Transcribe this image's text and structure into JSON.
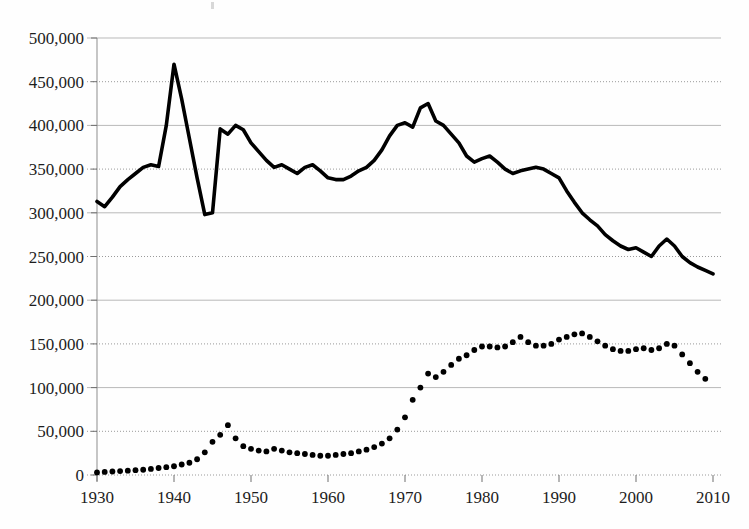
{
  "chart_data": {
    "type": "line",
    "title": "",
    "xlabel": "",
    "ylabel": "",
    "xlim": [
      1930,
      2010
    ],
    "ylim": [
      0,
      500000
    ],
    "grid": true,
    "legend": "none",
    "x_tick_labels": [
      "1930",
      "1940",
      "1950",
      "1960",
      "1970",
      "1980",
      "1990",
      "2000",
      "2010"
    ],
    "x_ticks": [
      1930,
      1940,
      1950,
      1960,
      1970,
      1980,
      1990,
      2000,
      2010
    ],
    "y_tick_labels": [
      "0",
      "50,000",
      "100,000",
      "150,000",
      "200,000",
      "250,000",
      "300,000",
      "350,000",
      "400,000",
      "450,000",
      "500,000"
    ],
    "y_ticks": [
      0,
      50000,
      100000,
      150000,
      200000,
      250000,
      300000,
      350000,
      400000,
      450000,
      500000
    ],
    "series": [
      {
        "name": "solid-line-series",
        "style": "solid",
        "color": "#000000",
        "x": [
          1930,
          1931,
          1932,
          1933,
          1934,
          1935,
          1936,
          1937,
          1938,
          1939,
          1940,
          1941,
          1942,
          1943,
          1944,
          1945,
          1946,
          1947,
          1948,
          1949,
          1950,
          1951,
          1952,
          1953,
          1954,
          1955,
          1956,
          1957,
          1958,
          1959,
          1960,
          1961,
          1962,
          1963,
          1964,
          1965,
          1966,
          1967,
          1968,
          1969,
          1970,
          1971,
          1972,
          1973,
          1974,
          1975,
          1976,
          1977,
          1978,
          1979,
          1980,
          1981,
          1982,
          1983,
          1984,
          1985,
          1986,
          1987,
          1988,
          1989,
          1990,
          1991,
          1992,
          1993,
          1994,
          1995,
          1996,
          1997,
          1998,
          1999,
          2000,
          2001,
          2002,
          2003,
          2004,
          2005,
          2006,
          2007,
          2008,
          2009,
          2010
        ],
        "values": [
          313000,
          307000,
          318000,
          330000,
          338000,
          345000,
          352000,
          355000,
          353000,
          400000,
          470000,
          430000,
          385000,
          340000,
          298000,
          300000,
          396000,
          390000,
          400000,
          395000,
          380000,
          370000,
          360000,
          352000,
          355000,
          350000,
          345000,
          352000,
          355000,
          348000,
          340000,
          338000,
          338000,
          342000,
          348000,
          352000,
          360000,
          372000,
          388000,
          400000,
          403000,
          398000,
          420000,
          425000,
          405000,
          400000,
          390000,
          380000,
          365000,
          358000,
          362000,
          365000,
          358000,
          350000,
          345000,
          348000,
          350000,
          352000,
          350000,
          345000,
          340000,
          325000,
          312000,
          300000,
          292000,
          285000,
          275000,
          268000,
          262000,
          258000,
          260000,
          255000,
          250000,
          262000,
          270000,
          262000,
          250000,
          243000,
          238000,
          234000,
          230000
        ]
      },
      {
        "name": "dotted-line-series",
        "style": "dotted",
        "color": "#000000",
        "x": [
          1930,
          1931,
          1932,
          1933,
          1934,
          1935,
          1936,
          1937,
          1938,
          1939,
          1940,
          1941,
          1942,
          1943,
          1944,
          1945,
          1946,
          1947,
          1948,
          1949,
          1950,
          1951,
          1952,
          1953,
          1954,
          1955,
          1956,
          1957,
          1958,
          1959,
          1960,
          1961,
          1962,
          1963,
          1964,
          1965,
          1966,
          1967,
          1968,
          1969,
          1970,
          1971,
          1972,
          1973,
          1974,
          1975,
          1976,
          1977,
          1978,
          1979,
          1980,
          1981,
          1982,
          1983,
          1984,
          1985,
          1986,
          1987,
          1988,
          1989,
          1990,
          1991,
          1992,
          1993,
          1994,
          1995,
          1996,
          1997,
          1998,
          1999,
          2000,
          2001,
          2002,
          2003,
          2004,
          2005,
          2006,
          2007,
          2008,
          2009
        ],
        "values": [
          3000,
          3500,
          4000,
          4500,
          5000,
          5500,
          6000,
          7000,
          8000,
          9000,
          10000,
          12000,
          14000,
          18000,
          26000,
          38000,
          46000,
          57000,
          42000,
          33000,
          30000,
          28000,
          27000,
          30000,
          28000,
          26000,
          25000,
          24000,
          23000,
          22000,
          22000,
          23000,
          24000,
          25000,
          27000,
          29000,
          32000,
          36000,
          42000,
          52000,
          66000,
          86000,
          100000,
          116000,
          112000,
          118000,
          126000,
          133000,
          137000,
          143000,
          147000,
          147000,
          146000,
          147000,
          152000,
          158000,
          152000,
          148000,
          148000,
          150000,
          155000,
          158000,
          161000,
          162000,
          158000,
          153000,
          148000,
          144000,
          142000,
          142000,
          144000,
          145000,
          143000,
          145000,
          150000,
          148000,
          138000,
          128000,
          118000,
          110000
        ]
      }
    ]
  }
}
